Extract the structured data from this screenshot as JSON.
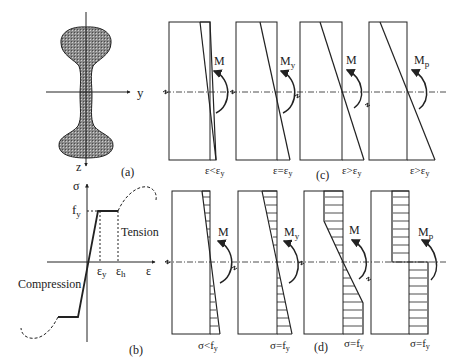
{
  "figure": {
    "panels": {
      "a": {
        "label": "(a)",
        "axis_y": "y",
        "axis_z": "z"
      },
      "b": {
        "label": "(b)",
        "axis_sigma": "σ",
        "axis_eps": "ε",
        "fy": "f",
        "fy_sub": "y",
        "eps_y": "ε",
        "eps_y_sub": "y",
        "eps_h": "ε",
        "eps_h_sub": "h",
        "tension": "Tension",
        "compression": "Compression"
      },
      "c": {
        "label": "(c)",
        "diagrams": [
          {
            "moment": "M",
            "moment_sub": "",
            "cond": "ε<ε",
            "cond_sub": "y"
          },
          {
            "moment": "M",
            "moment_sub": "y",
            "cond": "ε=ε",
            "cond_sub": "y"
          },
          {
            "moment": "M",
            "moment_sub": "",
            "cond": "ε>ε",
            "cond_sub": "y"
          },
          {
            "moment": "M",
            "moment_sub": "p",
            "cond": "ε>ε",
            "cond_sub": "y"
          }
        ]
      },
      "d": {
        "label": "(d)",
        "diagrams": [
          {
            "moment": "M",
            "moment_sub": "",
            "cond": "σ<f",
            "cond_sub": "y"
          },
          {
            "moment": "M",
            "moment_sub": "y",
            "cond": "σ=f",
            "cond_sub": "y"
          },
          {
            "moment": "M",
            "moment_sub": "",
            "cond": "σ=f",
            "cond_sub": "y"
          },
          {
            "moment": "M",
            "moment_sub": "p",
            "cond": "σ=f",
            "cond_sub": "y"
          }
        ]
      }
    }
  }
}
